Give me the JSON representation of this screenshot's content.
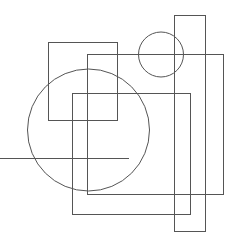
{
  "canvas": {
    "width": 234,
    "height": 240,
    "background": "#ffffff",
    "stroke": "#555555",
    "stroke_width": 1
  },
  "shapes": {
    "rects": [
      {
        "name": "tall-rect",
        "x": 174.5,
        "y": 15.5,
        "w": 31,
        "h": 216
      },
      {
        "name": "right-rect",
        "x": 87.5,
        "y": 54.5,
        "w": 136,
        "h": 140
      },
      {
        "name": "upper-left-rect",
        "x": 48.5,
        "y": 42.5,
        "w": 69,
        "h": 78
      },
      {
        "name": "middle-rect",
        "x": 72.5,
        "y": 93.5,
        "w": 118,
        "h": 121
      }
    ],
    "circles": [
      {
        "name": "small-circle",
        "cx": 161,
        "cy": 54.5,
        "r": 22.5
      },
      {
        "name": "large-circle",
        "cx": 88.5,
        "cy": 130,
        "r": 61
      }
    ],
    "lines": [
      {
        "name": "horizontal-line",
        "x1": 0,
        "y1": 158.5,
        "x2": 129,
        "y2": 158.5
      }
    ]
  }
}
